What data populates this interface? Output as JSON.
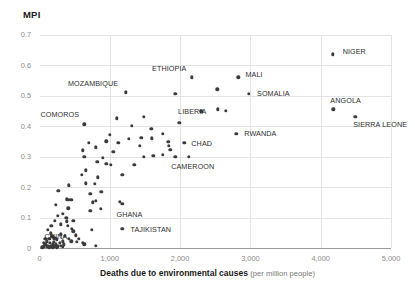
{
  "chart_data": {
    "type": "scatter",
    "title": "",
    "ylabel": "MPI",
    "xlabel_bold": "Deaths due to environmental causes",
    "xlabel_sub": "(per million people)",
    "xlim": [
      0,
      5000
    ],
    "ylim": [
      0,
      0.7
    ],
    "grid": true,
    "legend": "none",
    "xticks": [
      "0",
      "1,000",
      "2,000",
      "3,000",
      "4,000",
      "5,000"
    ],
    "xtick_values": [
      0,
      1000,
      2000,
      3000,
      4000,
      5000
    ],
    "yticks": [
      "0",
      "0.1",
      "0.2",
      "0.3",
      "0.4",
      "0.5",
      "0.6",
      "0.7"
    ],
    "ytick_values": [
      0,
      0.1,
      0.2,
      0.3,
      0.4,
      0.5,
      0.6,
      0.7
    ],
    "marker_color": "#3b3b3b",
    "grid_color": "#e4e4e4",
    "axis_color": "#9a9a9a",
    "points": [
      {
        "x": 4170,
        "y": 0.635,
        "label": "NIGER",
        "lx": 10,
        "ly": -3
      },
      {
        "x": 2830,
        "y": 0.56,
        "label": "MALI",
        "lx": 7,
        "ly": -3
      },
      {
        "x": 2980,
        "y": 0.505,
        "label": "SOMALIA",
        "lx": 8,
        "ly": -1
      },
      {
        "x": 2170,
        "y": 0.56,
        "label": "ETHIOPIA",
        "lx": -40,
        "ly": -9
      },
      {
        "x": 2530,
        "y": 0.52,
        "label": "",
        "lx": 0,
        "ly": 0
      },
      {
        "x": 2540,
        "y": 0.455,
        "label": "LIBERIA",
        "lx": -40,
        "ly": 2
      },
      {
        "x": 4180,
        "y": 0.455,
        "label": "ANGOLA",
        "lx": -3,
        "ly": -9
      },
      {
        "x": 4490,
        "y": 0.43,
        "label": "SIERRA LEONE",
        "lx": -2,
        "ly": 7
      },
      {
        "x": 2800,
        "y": 0.375,
        "label": "RWANDA",
        "lx": 8,
        "ly": -1
      },
      {
        "x": 1230,
        "y": 0.51,
        "label": "MOZAMBIQUE",
        "lx": -58,
        "ly": -9
      },
      {
        "x": 1930,
        "y": 0.505,
        "label": "",
        "lx": 0,
        "ly": 0
      },
      {
        "x": 640,
        "y": 0.405,
        "label": "COMOROS",
        "lx": -44,
        "ly": -10
      },
      {
        "x": 2060,
        "y": 0.345,
        "label": "CHAD",
        "lx": 7,
        "ly": 0
      },
      {
        "x": 1930,
        "y": 0.3,
        "label": "CAMEROON",
        "lx": -4,
        "ly": 9
      },
      {
        "x": 1180,
        "y": 0.145,
        "label": "GHANA",
        "lx": -6,
        "ly": 10
      },
      {
        "x": 1180,
        "y": 0.062,
        "label": "TAJIKISTAN",
        "lx": 8,
        "ly": 0
      },
      {
        "x": 200,
        "y": 0.02,
        "label": "CHINA",
        "lx": -9,
        "ly": -6
      },
      {
        "x": 1990,
        "y": 0.41,
        "label": "",
        "lx": 0,
        "ly": 0
      },
      {
        "x": 1750,
        "y": 0.375,
        "label": "",
        "lx": 0,
        "ly": 0
      },
      {
        "x": 1600,
        "y": 0.36,
        "label": "",
        "lx": 0,
        "ly": 0
      },
      {
        "x": 1830,
        "y": 0.348,
        "label": "",
        "lx": 0,
        "ly": 0
      },
      {
        "x": 1840,
        "y": 0.335,
        "label": "",
        "lx": 0,
        "ly": 0
      },
      {
        "x": 1860,
        "y": 0.322,
        "label": "",
        "lx": 0,
        "ly": 0
      },
      {
        "x": 1450,
        "y": 0.362,
        "label": "",
        "lx": 0,
        "ly": 0
      },
      {
        "x": 1590,
        "y": 0.39,
        "label": "",
        "lx": 0,
        "ly": 0
      },
      {
        "x": 1270,
        "y": 0.358,
        "label": "",
        "lx": 0,
        "ly": 0
      },
      {
        "x": 1120,
        "y": 0.345,
        "label": "",
        "lx": 0,
        "ly": 0
      },
      {
        "x": 950,
        "y": 0.35,
        "label": "",
        "lx": 0,
        "ly": 0
      },
      {
        "x": 1000,
        "y": 0.372,
        "label": "",
        "lx": 0,
        "ly": 0
      },
      {
        "x": 800,
        "y": 0.33,
        "label": "",
        "lx": 0,
        "ly": 0
      },
      {
        "x": 700,
        "y": 0.345,
        "label": "",
        "lx": 0,
        "ly": 0
      },
      {
        "x": 620,
        "y": 0.32,
        "label": "",
        "lx": 0,
        "ly": 0
      },
      {
        "x": 640,
        "y": 0.3,
        "label": "",
        "lx": 0,
        "ly": 0
      },
      {
        "x": 1430,
        "y": 0.335,
        "label": "",
        "lx": 0,
        "ly": 0
      },
      {
        "x": 1480,
        "y": 0.3,
        "label": "",
        "lx": 0,
        "ly": 0
      },
      {
        "x": 1750,
        "y": 0.305,
        "label": "",
        "lx": 0,
        "ly": 0
      },
      {
        "x": 2120,
        "y": 0.3,
        "label": "",
        "lx": 0,
        "ly": 0
      },
      {
        "x": 1050,
        "y": 0.315,
        "label": "",
        "lx": 0,
        "ly": 0
      },
      {
        "x": 900,
        "y": 0.295,
        "label": "",
        "lx": 0,
        "ly": 0
      },
      {
        "x": 950,
        "y": 0.277,
        "label": "",
        "lx": 0,
        "ly": 0
      },
      {
        "x": 1010,
        "y": 0.272,
        "label": "",
        "lx": 0,
        "ly": 0
      },
      {
        "x": 820,
        "y": 0.282,
        "label": "",
        "lx": 0,
        "ly": 0
      },
      {
        "x": 1350,
        "y": 0.272,
        "label": "",
        "lx": 0,
        "ly": 0
      },
      {
        "x": 1180,
        "y": 0.24,
        "label": "",
        "lx": 0,
        "ly": 0
      },
      {
        "x": 830,
        "y": 0.232,
        "label": "",
        "lx": 0,
        "ly": 0
      },
      {
        "x": 790,
        "y": 0.21,
        "label": "",
        "lx": 0,
        "ly": 0
      },
      {
        "x": 660,
        "y": 0.212,
        "label": "",
        "lx": 0,
        "ly": 0
      },
      {
        "x": 880,
        "y": 0.185,
        "label": "",
        "lx": 0,
        "ly": 0
      },
      {
        "x": 720,
        "y": 0.178,
        "label": "",
        "lx": 0,
        "ly": 0
      },
      {
        "x": 800,
        "y": 0.155,
        "label": "",
        "lx": 0,
        "ly": 0
      },
      {
        "x": 760,
        "y": 0.15,
        "label": "",
        "lx": 0,
        "ly": 0
      },
      {
        "x": 870,
        "y": 0.128,
        "label": "",
        "lx": 0,
        "ly": 0
      },
      {
        "x": 720,
        "y": 0.122,
        "label": "",
        "lx": 0,
        "ly": 0
      },
      {
        "x": 1140,
        "y": 0.152,
        "label": "",
        "lx": 0,
        "ly": 0
      },
      {
        "x": 420,
        "y": 0.205,
        "label": "",
        "lx": 0,
        "ly": 0
      },
      {
        "x": 270,
        "y": 0.188,
        "label": "",
        "lx": 0,
        "ly": 0
      },
      {
        "x": 230,
        "y": 0.142,
        "label": "",
        "lx": 0,
        "ly": 0
      },
      {
        "x": 390,
        "y": 0.16,
        "label": "",
        "lx": 0,
        "ly": 0
      },
      {
        "x": 420,
        "y": 0.158,
        "label": "",
        "lx": 0,
        "ly": 0
      },
      {
        "x": 450,
        "y": 0.158,
        "label": "",
        "lx": 0,
        "ly": 0
      },
      {
        "x": 410,
        "y": 0.13,
        "label": "",
        "lx": 0,
        "ly": 0
      },
      {
        "x": 260,
        "y": 0.105,
        "label": "",
        "lx": 0,
        "ly": 0
      },
      {
        "x": 380,
        "y": 0.1,
        "label": "",
        "lx": 0,
        "ly": 0
      },
      {
        "x": 390,
        "y": 0.088,
        "label": "",
        "lx": 0,
        "ly": 0
      },
      {
        "x": 480,
        "y": 0.09,
        "label": "",
        "lx": 0,
        "ly": 0
      },
      {
        "x": 300,
        "y": 0.078,
        "label": "",
        "lx": 0,
        "ly": 0
      },
      {
        "x": 400,
        "y": 0.072,
        "label": "",
        "lx": 0,
        "ly": 0
      },
      {
        "x": 460,
        "y": 0.062,
        "label": "",
        "lx": 0,
        "ly": 0
      },
      {
        "x": 480,
        "y": 0.055,
        "label": "",
        "lx": 0,
        "ly": 0
      },
      {
        "x": 740,
        "y": 0.06,
        "label": "",
        "lx": 0,
        "ly": 0
      },
      {
        "x": 300,
        "y": 0.045,
        "label": "",
        "lx": 0,
        "ly": 0
      },
      {
        "x": 360,
        "y": 0.04,
        "label": "",
        "lx": 0,
        "ly": 0
      },
      {
        "x": 420,
        "y": 0.03,
        "label": "",
        "lx": 0,
        "ly": 0
      },
      {
        "x": 450,
        "y": 0.022,
        "label": "",
        "lx": 0,
        "ly": 0
      },
      {
        "x": 530,
        "y": 0.02,
        "label": "",
        "lx": 0,
        "ly": 0
      },
      {
        "x": 620,
        "y": 0.018,
        "label": "",
        "lx": 0,
        "ly": 0
      },
      {
        "x": 640,
        "y": 0.012,
        "label": "",
        "lx": 0,
        "ly": 0
      },
      {
        "x": 800,
        "y": 0.008,
        "label": "",
        "lx": 0,
        "ly": 0
      },
      {
        "x": 120,
        "y": 0.06,
        "label": "",
        "lx": 0,
        "ly": 0
      },
      {
        "x": 160,
        "y": 0.048,
        "label": "",
        "lx": 0,
        "ly": 0
      },
      {
        "x": 180,
        "y": 0.038,
        "label": "",
        "lx": 0,
        "ly": 0
      },
      {
        "x": 140,
        "y": 0.03,
        "label": "",
        "lx": 0,
        "ly": 0
      },
      {
        "x": 210,
        "y": 0.032,
        "label": "",
        "lx": 0,
        "ly": 0
      },
      {
        "x": 250,
        "y": 0.028,
        "label": "",
        "lx": 0,
        "ly": 0
      },
      {
        "x": 100,
        "y": 0.022,
        "label": "",
        "lx": 0,
        "ly": 0
      },
      {
        "x": 150,
        "y": 0.018,
        "label": "",
        "lx": 0,
        "ly": 0
      },
      {
        "x": 190,
        "y": 0.014,
        "label": "",
        "lx": 0,
        "ly": 0
      },
      {
        "x": 230,
        "y": 0.012,
        "label": "",
        "lx": 0,
        "ly": 0
      },
      {
        "x": 80,
        "y": 0.012,
        "label": "",
        "lx": 0,
        "ly": 0
      },
      {
        "x": 120,
        "y": 0.008,
        "label": "",
        "lx": 0,
        "ly": 0
      },
      {
        "x": 170,
        "y": 0.006,
        "label": "",
        "lx": 0,
        "ly": 0
      },
      {
        "x": 210,
        "y": 0.005,
        "label": "",
        "lx": 0,
        "ly": 0
      },
      {
        "x": 260,
        "y": 0.006,
        "label": "",
        "lx": 0,
        "ly": 0
      },
      {
        "x": 300,
        "y": 0.008,
        "label": "",
        "lx": 0,
        "ly": 0
      },
      {
        "x": 60,
        "y": 0.005,
        "label": "",
        "lx": 0,
        "ly": 0
      },
      {
        "x": 100,
        "y": 0.003,
        "label": "",
        "lx": 0,
        "ly": 0
      },
      {
        "x": 140,
        "y": 0.002,
        "label": "",
        "lx": 0,
        "ly": 0
      },
      {
        "x": 190,
        "y": 0.002,
        "label": "",
        "lx": 0,
        "ly": 0
      },
      {
        "x": 40,
        "y": 0.002,
        "label": "",
        "lx": 0,
        "ly": 0
      },
      {
        "x": 250,
        "y": 0.002,
        "label": "",
        "lx": 0,
        "ly": 0
      },
      {
        "x": 330,
        "y": 0.004,
        "label": "",
        "lx": 0,
        "ly": 0
      },
      {
        "x": 350,
        "y": 0.012,
        "label": "",
        "lx": 0,
        "ly": 0
      },
      {
        "x": 80,
        "y": 0.03,
        "label": "",
        "lx": 0,
        "ly": 0
      },
      {
        "x": 60,
        "y": 0.018,
        "label": "",
        "lx": 0,
        "ly": 0
      },
      {
        "x": 290,
        "y": 0.018,
        "label": "",
        "lx": 0,
        "ly": 0
      },
      {
        "x": 330,
        "y": 0.022,
        "label": "",
        "lx": 0,
        "ly": 0
      },
      {
        "x": 520,
        "y": 0.042,
        "label": "",
        "lx": 0,
        "ly": 0
      },
      {
        "x": 560,
        "y": 0.03,
        "label": "",
        "lx": 0,
        "ly": 0
      },
      {
        "x": 170,
        "y": 0.072,
        "label": "",
        "lx": 0,
        "ly": 0
      },
      {
        "x": 220,
        "y": 0.09,
        "label": "",
        "lx": 0,
        "ly": 0
      },
      {
        "x": 330,
        "y": 0.112,
        "label": "",
        "lx": 0,
        "ly": 0
      },
      {
        "x": 600,
        "y": 0.24,
        "label": "",
        "lx": 0,
        "ly": 0
      },
      {
        "x": 660,
        "y": 0.255,
        "label": "",
        "lx": 0,
        "ly": 0
      },
      {
        "x": 1100,
        "y": 0.425,
        "label": "",
        "lx": 0,
        "ly": 0
      },
      {
        "x": 1310,
        "y": 0.4,
        "label": "",
        "lx": 0,
        "ly": 0
      },
      {
        "x": 1480,
        "y": 0.43,
        "label": "",
        "lx": 0,
        "ly": 0
      },
      {
        "x": 2300,
        "y": 0.448,
        "label": "",
        "lx": 0,
        "ly": 0
      },
      {
        "x": 2650,
        "y": 0.45,
        "label": "",
        "lx": 0,
        "ly": 0
      },
      {
        "x": 1620,
        "y": 0.303,
        "label": "",
        "lx": 0,
        "ly": 0
      }
    ]
  }
}
